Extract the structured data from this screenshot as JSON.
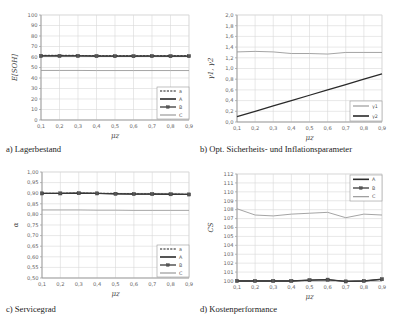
{
  "chart_data": [
    {
      "id": "a",
      "type": "line",
      "caption": "a) Lagerbestand",
      "xlabel": "μz",
      "ylabel": "E[SOH]",
      "x": [
        0.1,
        0.2,
        0.3,
        0.4,
        0.5,
        0.6,
        0.7,
        0.8,
        0.9
      ],
      "xticks": [
        "0,1",
        "0,2",
        "0,3",
        "0,4",
        "0,5",
        "0,6",
        "0,7",
        "0,8",
        "0,9"
      ],
      "ylim": [
        0,
        100
      ],
      "yticks": [
        "0",
        "10",
        "20",
        "30",
        "40",
        "50",
        "60",
        "70",
        "80",
        "90",
        "100"
      ],
      "grid": true,
      "legend_position": "lower right",
      "series": [
        {
          "name": "a",
          "style": "dashed",
          "values": [
            61.5,
            61.5,
            61.5,
            61.4,
            61.3,
            61.3,
            61.4,
            61.3,
            61.3
          ]
        },
        {
          "name": "A",
          "style": "solid-dark",
          "values": [
            61.0,
            61.0,
            61.0,
            60.9,
            60.8,
            60.8,
            60.9,
            60.8,
            60.8
          ]
        },
        {
          "name": "B",
          "style": "marker",
          "values": [
            61.0,
            61.0,
            61.0,
            60.9,
            60.8,
            60.8,
            60.9,
            60.8,
            60.8
          ]
        },
        {
          "name": "C",
          "style": "solid-light",
          "values": [
            47.2,
            47.2,
            47.2,
            47.1,
            47.1,
            47.1,
            47.1,
            47.1,
            47.1
          ]
        }
      ]
    },
    {
      "id": "b",
      "type": "line",
      "caption": "b) Opt. Sicherheits- und Inflationsparameter",
      "xlabel": "μz",
      "ylabel": "γ1, γ2",
      "x": [
        0.1,
        0.2,
        0.3,
        0.4,
        0.5,
        0.6,
        0.7,
        0.8,
        0.9
      ],
      "xticks": [
        "0,1",
        "0,2",
        "0,3",
        "0,4",
        "0,5",
        "0,6",
        "0,7",
        "0,8",
        "0,9"
      ],
      "ylim": [
        0,
        2.0
      ],
      "yticks": [
        "0,0",
        "0,2",
        "0,4",
        "0,6",
        "0,8",
        "1,0",
        "1,2",
        "1,4",
        "1,6",
        "1,8",
        "2,0"
      ],
      "grid": true,
      "legend_position": "lower right",
      "series": [
        {
          "name": "γ1",
          "style": "solid-light",
          "values": [
            1.31,
            1.32,
            1.31,
            1.28,
            1.28,
            1.27,
            1.3,
            1.3,
            1.3
          ]
        },
        {
          "name": "γ2",
          "style": "solid-dark",
          "values": [
            0.1,
            0.2,
            0.3,
            0.4,
            0.5,
            0.6,
            0.7,
            0.8,
            0.9
          ]
        }
      ]
    },
    {
      "id": "c",
      "type": "line",
      "caption": "c) Servicegrad",
      "xlabel": "μz",
      "ylabel": "α",
      "x": [
        0.1,
        0.2,
        0.3,
        0.4,
        0.5,
        0.6,
        0.7,
        0.8,
        0.9
      ],
      "xticks": [
        "0,1",
        "0,2",
        "0,3",
        "0,4",
        "0,5",
        "0,6",
        "0,7",
        "0,8",
        "0,9"
      ],
      "ylim": [
        0.5,
        1.0
      ],
      "yticks": [
        "0,50",
        "0,55",
        "0,60",
        "0,65",
        "0,70",
        "0,75",
        "0,80",
        "0,85",
        "0,90",
        "0,95",
        "1,00"
      ],
      "grid": true,
      "legend_position": "lower right",
      "series": [
        {
          "name": "a",
          "style": "dashed",
          "values": [
            0.9,
            0.9,
            0.901,
            0.9,
            0.899,
            0.898,
            0.897,
            0.896,
            0.895
          ]
        },
        {
          "name": "A",
          "style": "solid-dark",
          "values": [
            0.899,
            0.899,
            0.9,
            0.899,
            0.897,
            0.896,
            0.896,
            0.895,
            0.894
          ]
        },
        {
          "name": "B",
          "style": "marker",
          "values": [
            0.899,
            0.899,
            0.9,
            0.899,
            0.897,
            0.896,
            0.896,
            0.895,
            0.894
          ]
        },
        {
          "name": "C",
          "style": "solid-light",
          "values": [
            0.821,
            0.821,
            0.821,
            0.82,
            0.82,
            0.819,
            0.819,
            0.819,
            0.819
          ]
        }
      ]
    },
    {
      "id": "d",
      "type": "line",
      "caption": "d) Kostenperformance",
      "xlabel": "μz",
      "ylabel": "CS",
      "x": [
        0.1,
        0.2,
        0.3,
        0.4,
        0.5,
        0.6,
        0.7,
        0.8,
        0.9
      ],
      "xticks": [
        "0,1",
        "0,2",
        "0,3",
        "0,4",
        "0,5",
        "0,6",
        "0,7",
        "0,8",
        "0,9"
      ],
      "ylim": [
        100,
        112
      ],
      "yticks": [
        "100",
        "101",
        "102",
        "103",
        "104",
        "105",
        "106",
        "107",
        "108",
        "109",
        "110",
        "111",
        "112"
      ],
      "grid": true,
      "legend_position": "upper right",
      "series": [
        {
          "name": "A",
          "style": "solid-dark",
          "values": [
            100.0,
            100.0,
            100.0,
            100.0,
            100.1,
            100.15,
            99.95,
            100.0,
            100.2
          ]
        },
        {
          "name": "B",
          "style": "marker",
          "values": [
            100.0,
            100.0,
            100.0,
            100.0,
            100.1,
            100.15,
            99.95,
            100.0,
            100.2
          ]
        },
        {
          "name": "C",
          "style": "solid-light",
          "values": [
            108.1,
            107.4,
            107.3,
            107.5,
            107.6,
            107.7,
            107.1,
            107.5,
            107.4
          ]
        }
      ]
    }
  ],
  "colors": {
    "dark": "#2a2a2a",
    "marker": "#3a3a3a",
    "light": "#9a9a9a",
    "dashed": "#6a6a6a",
    "grid": "#d8d8d8",
    "axis": "#888888"
  }
}
